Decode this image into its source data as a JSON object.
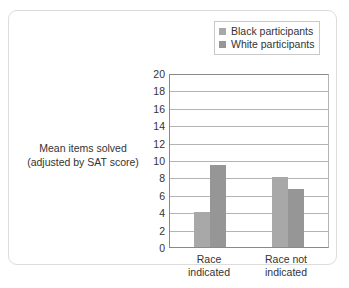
{
  "chart_data": {
    "type": "bar",
    "title": "",
    "xlabel": "",
    "ylabel": "Mean items solved (adjusted by SAT score)",
    "ylabel_lines": [
      "Mean items solved",
      "(adjusted by SAT score)"
    ],
    "categories": [
      "Race indicated",
      "Race not indicated"
    ],
    "category_lines": [
      [
        "Race",
        "indicated"
      ],
      [
        "Race not",
        "indicated"
      ]
    ],
    "series": [
      {
        "name": "Black participants",
        "color": "#a8a8a8",
        "values": [
          4.0,
          8.0
        ]
      },
      {
        "name": "White participants",
        "color": "#969696",
        "values": [
          9.4,
          6.7
        ]
      }
    ],
    "ylim": [
      0,
      20
    ],
    "ytick_step": 2,
    "yticks": [
      20,
      18,
      16,
      14,
      12,
      10,
      8,
      6,
      4,
      2,
      0
    ],
    "ytick_labels": [
      "20",
      "18",
      "16",
      "14",
      "12",
      "10",
      "8",
      "6",
      "4",
      "2",
      "0"
    ],
    "grid": true,
    "grid_axis": "y",
    "legend_position": "top-right",
    "legend": [
      "Black participants",
      "White participants"
    ]
  },
  "legend": {
    "items": [
      {
        "label": "Black participants",
        "color": "#a8a8a8"
      },
      {
        "label": "White participants",
        "color": "#969696"
      }
    ]
  },
  "axis_title": {
    "line1": "Mean items solved",
    "line2": "(adjusted by SAT score)"
  },
  "categories": [
    {
      "line1": "Race",
      "line2": "indicated"
    },
    {
      "line1": "Race not",
      "line2": "indicated"
    }
  ],
  "colors": {
    "series_black": "#a8a8a8",
    "series_white": "#969696",
    "grid": "#b4b4b4",
    "axis": "#8a8a8a",
    "text": "#333333",
    "card_border": "#dcdcdc"
  }
}
